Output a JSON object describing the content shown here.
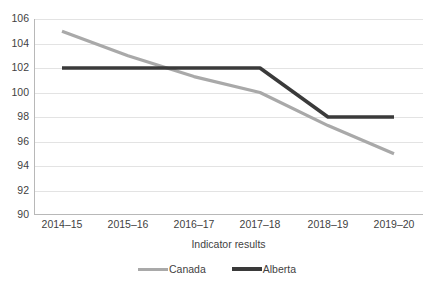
{
  "chart_data": {
    "type": "line",
    "title": "",
    "subtitle": "",
    "xlabel": "Indicator results",
    "ylabel": "",
    "categories": [
      "2014–15",
      "2015–16",
      "2016–17",
      "2017–18",
      "2018–19",
      "2019–20"
    ],
    "series": [
      {
        "name": "Canada",
        "color": "#a9a9a9",
        "values": [
          105,
          103,
          101.3,
          100,
          97.3,
          95
        ]
      },
      {
        "name": "Alberta",
        "color": "#3a3a3a",
        "values": [
          102,
          102,
          102,
          102,
          98,
          98
        ]
      }
    ],
    "ylim": [
      90,
      106
    ],
    "yticks": [
      90,
      92,
      94,
      96,
      98,
      100,
      102,
      104,
      106
    ],
    "ytick_labels": [
      "90",
      "92",
      "94",
      "96",
      "98",
      "100",
      "102",
      "104",
      "106"
    ],
    "grid": "horizontal",
    "legend_position": "bottom"
  },
  "axes": {
    "y_tick_labels": [
      "106",
      "104",
      "102",
      "100",
      "98",
      "96",
      "94",
      "92",
      "90"
    ],
    "x_tick_labels": [
      "2014–15",
      "2015–16",
      "2016–17",
      "2017–18",
      "2018–19",
      "2019–20"
    ],
    "x_axis_title": "Indicator results"
  },
  "legend": {
    "items": [
      {
        "label": "Canada",
        "color": "#a9a9a9"
      },
      {
        "label": "Alberta",
        "color": "#3a3a3a"
      }
    ]
  },
  "colors": {
    "canada_line": "#a9a9a9",
    "alberta_line": "#3a3a3a",
    "gridline": "#e3e3e3",
    "axis": "#b8b8b8",
    "text": "#3f3f3f",
    "background": "#ffffff"
  }
}
